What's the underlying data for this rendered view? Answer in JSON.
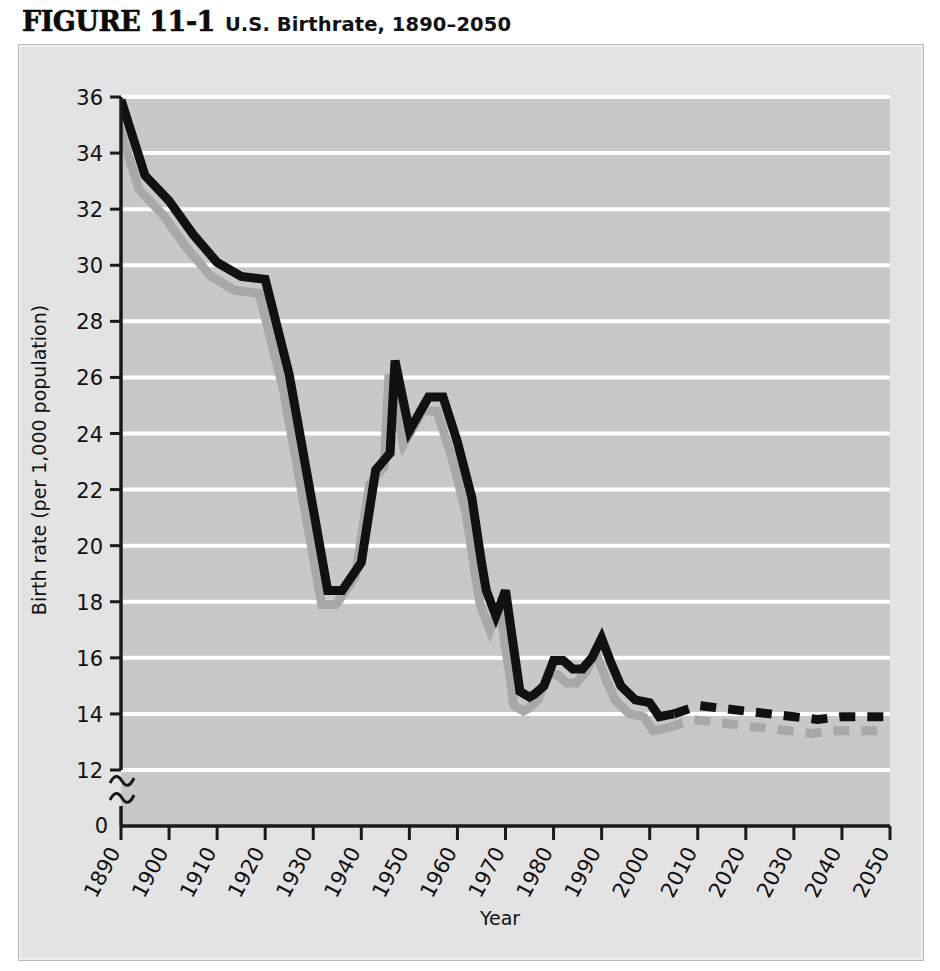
{
  "figure": {
    "number": "FIGURE 11-1",
    "title": "U.S. Birthrate, 1890–2050"
  },
  "colors": {
    "page_background": "#ffffff",
    "panel_background": "#e3e3e3",
    "plot_background": "#c8c8c8",
    "gridline": "#ffffff",
    "axis": "#1a1a1a",
    "series_primary": "#111111",
    "series_shadow": "#a8a8a8"
  },
  "chart_data": {
    "type": "line",
    "title": "U.S. Birthrate, 1890–2050",
    "xlabel": "Year",
    "ylabel": "Birth rate (per 1,000 population)",
    "xlim": [
      1890,
      2050
    ],
    "ylim": [
      12,
      36
    ],
    "y_axis_break": true,
    "y_axis_break_note": "axis broken between 0 and 12",
    "grid": "horizontal",
    "legend": "none",
    "x_ticks": [
      "1890",
      "1900",
      "1910",
      "1920",
      "1930",
      "1940",
      "1950",
      "1960",
      "1970",
      "1980",
      "1990",
      "2000",
      "2010",
      "2020",
      "2030",
      "2040",
      "2050"
    ],
    "y_ticks": [
      "0",
      "12",
      "14",
      "16",
      "18",
      "20",
      "22",
      "24",
      "26",
      "28",
      "30",
      "32",
      "34",
      "36"
    ],
    "projection_starts": 2005,
    "series": [
      {
        "name": "U.S. birth rate",
        "style": "solid-with-dashed-projection",
        "color": "#111111",
        "x": [
          1890,
          1895,
          1900,
          1905,
          1910,
          1915,
          1920,
          1925,
          1930,
          1933,
          1936,
          1940,
          1943,
          1946,
          1947,
          1950,
          1954,
          1957,
          1960,
          1963,
          1965,
          1966,
          1968,
          1970,
          1971,
          1973,
          1975,
          1976,
          1978,
          1980,
          1982,
          1984,
          1986,
          1988,
          1990,
          1992,
          1994,
          1997,
          2000,
          2002,
          2005
        ],
        "y": [
          35.9,
          33.2,
          32.3,
          31.1,
          30.1,
          29.6,
          29.5,
          26.1,
          21.3,
          18.4,
          18.4,
          19.4,
          22.7,
          23.3,
          26.6,
          24.1,
          25.3,
          25.3,
          23.7,
          21.7,
          19.4,
          18.4,
          17.5,
          18.4,
          17.2,
          14.8,
          14.6,
          14.7,
          15.0,
          15.9,
          15.9,
          15.6,
          15.6,
          16.0,
          16.7,
          15.8,
          15.0,
          14.5,
          14.4,
          13.9,
          14.0
        ],
        "projection_x": [
          2005,
          2010,
          2015,
          2020,
          2025,
          2030,
          2035,
          2040,
          2045,
          2050
        ],
        "projection_y": [
          14.0,
          14.3,
          14.2,
          14.1,
          14.0,
          13.9,
          13.8,
          13.9,
          13.9,
          13.9
        ]
      },
      {
        "name": "offset shadow line",
        "style": "solid-with-dashed-projection",
        "color": "#a8a8a8",
        "offset_px": [
          -6,
          14
        ],
        "note": "gray drop-shadow duplicate of primary series"
      }
    ],
    "annotations": [
      {
        "label": "Great Depression trough",
        "x": 1936,
        "y": 18.4
      },
      {
        "label": "Baby boom peak",
        "x": 1957,
        "y": 24.6
      },
      {
        "label": "Baby bust low",
        "x": 1975,
        "y": 14.6
      },
      {
        "label": "Echo boom",
        "x": 1990,
        "y": 16.7
      }
    ]
  }
}
